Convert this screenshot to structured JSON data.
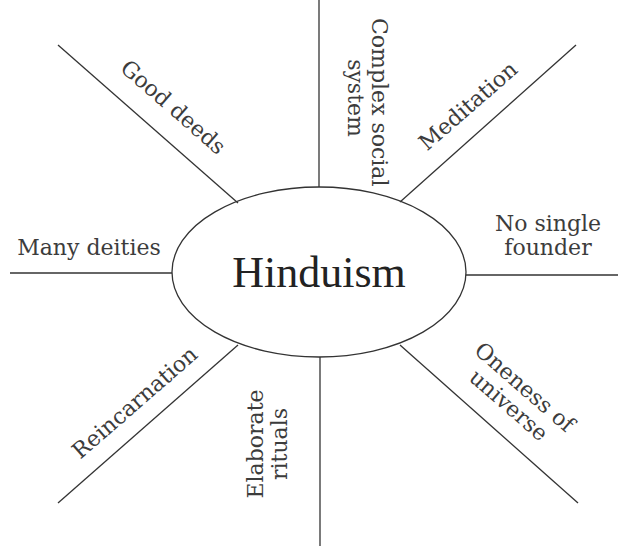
{
  "center": {
    "label": "Hinduism"
  },
  "spokes": [
    {
      "id": "top",
      "label": "Complex social system",
      "lines": [
        "Complex social",
        "system"
      ]
    },
    {
      "id": "top-right",
      "label": "Meditation",
      "lines": [
        "Meditation"
      ]
    },
    {
      "id": "right",
      "label": "No single founder",
      "lines": [
        "No single",
        "founder"
      ]
    },
    {
      "id": "bottom-right",
      "label": "Oneness of universe",
      "lines": [
        "Oneness of",
        "universe"
      ]
    },
    {
      "id": "bottom",
      "label": "Elaborate rituals",
      "lines": [
        "Elaborate",
        "rituals"
      ]
    },
    {
      "id": "bottom-left",
      "label": "Reincarnation",
      "lines": [
        "Reincarnation"
      ]
    },
    {
      "id": "left",
      "label": "Many deities",
      "lines": [
        "Many deities"
      ]
    },
    {
      "id": "top-left",
      "label": "Good deeds",
      "lines": [
        "Good deeds"
      ]
    }
  ],
  "colors": {
    "stroke": "#333333",
    "text": "#3c3c3c",
    "background": "#ffffff"
  }
}
